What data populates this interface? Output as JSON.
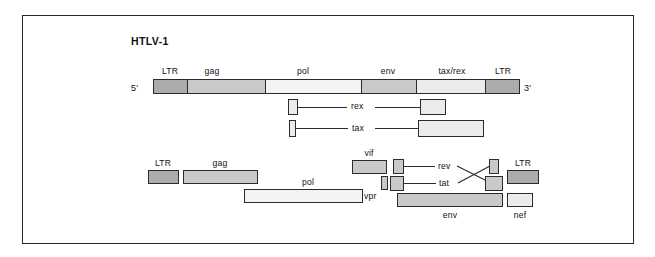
{
  "figure": {
    "type": "genome-map-diagram",
    "panels": [
      {
        "id": "htlv1",
        "title": "HTLV-1",
        "prime_left": "5'",
        "prime_right": "3'",
        "genome_bar": {
          "segments": [
            {
              "label": "LTR",
              "shade": "dark"
            },
            {
              "label": "gag",
              "shade": "mid"
            },
            {
              "label": "pol",
              "shade": "pale"
            },
            {
              "label": "env",
              "shade": "mid"
            },
            {
              "label": "tax/rex",
              "shade": "light"
            },
            {
              "label": "LTR",
              "shade": "dark"
            }
          ]
        },
        "spliced_transcripts": [
          {
            "label": "rex"
          },
          {
            "label": "tax"
          }
        ]
      },
      {
        "id": "hiv1",
        "title": "",
        "genes": [
          {
            "label": "LTR",
            "shade": "dark"
          },
          {
            "label": "gag",
            "shade": "mid"
          },
          {
            "label": "pol",
            "shade": "pale"
          },
          {
            "label": "vif",
            "shade": "mid"
          },
          {
            "label": "vpr",
            "shade": "mid"
          },
          {
            "label": "rev",
            "shade": "mid"
          },
          {
            "label": "tat",
            "shade": "mid"
          },
          {
            "label": "env",
            "shade": "mid"
          },
          {
            "label": "nef",
            "shade": "light"
          },
          {
            "label": "LTR",
            "shade": "dark"
          }
        ]
      }
    ]
  },
  "labels": {
    "htlv1_title": "HTLV-1",
    "five_prime": "5'",
    "three_prime": "3'",
    "ltr_1": "LTR",
    "gag_1": "gag",
    "pol_1": "pol",
    "env_1": "env",
    "taxrex": "tax/rex",
    "ltr_2": "LTR",
    "rex": "rex",
    "tax": "tax",
    "ltr_3": "LTR",
    "gag_2": "gag",
    "pol_2": "pol",
    "vif": "vif",
    "vpr": "vpr",
    "rev": "rev",
    "tat": "tat",
    "env_2": "env",
    "nef": "nef",
    "ltr_4": "LTR"
  },
  "colors": {
    "outline": "#2b2b2b",
    "frame": "#262626",
    "shade_dark": "#acacac",
    "shade_mid": "#c9c9c9",
    "shade_light": "#ebebeb",
    "shade_pale": "#f3f3f3",
    "text": "#111111",
    "background": "#ffffff"
  }
}
